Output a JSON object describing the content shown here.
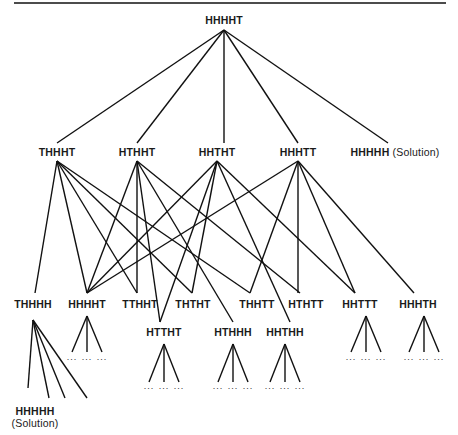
{
  "diagram": {
    "type": "search-tree",
    "root": {
      "label": "HHHHT"
    },
    "level2": [
      {
        "label": "THHHT"
      },
      {
        "label": "HTHHT"
      },
      {
        "label": "HHTHT"
      },
      {
        "label": "HHHTT"
      },
      {
        "label": "HHHHH",
        "note": "(Solution)"
      }
    ],
    "level3": [
      {
        "label": "THHHH"
      },
      {
        "label": "HHHHT"
      },
      {
        "label": "TTHHT"
      },
      {
        "label": "THTHT"
      },
      {
        "label": "THHTT"
      },
      {
        "label": "HTHTT"
      },
      {
        "label": "HHTTT"
      },
      {
        "label": "HHHTH"
      }
    ],
    "level3b": [
      {
        "label": "HTTHT"
      },
      {
        "label": "HTHHH"
      },
      {
        "label": "HHTHH"
      }
    ],
    "leaf_solution": {
      "label": "HHHHH",
      "note": "(Solution)"
    },
    "ellipsis": "..."
  }
}
